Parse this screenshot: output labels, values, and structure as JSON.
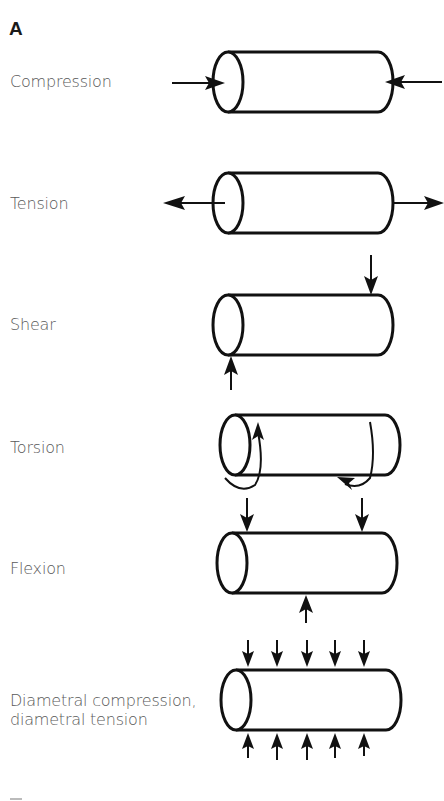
{
  "figure": {
    "panel_label": "A",
    "rows": [
      {
        "id": "compression",
        "label": "Compression"
      },
      {
        "id": "tension",
        "label": "Tension"
      },
      {
        "id": "shear",
        "label": "Shear"
      },
      {
        "id": "torsion",
        "label": "Torsion"
      },
      {
        "id": "flexion",
        "label": "Flexion"
      },
      {
        "id": "diametral",
        "label_line1": "Diametral compression,",
        "label_line2": "diametral tension"
      }
    ]
  }
}
